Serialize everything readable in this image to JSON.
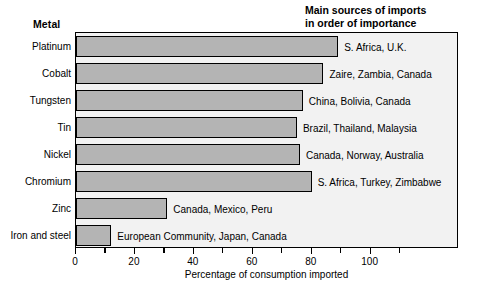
{
  "headers": {
    "metal": "Metal",
    "sources_line1": "Main sources of imports",
    "sources_line2": "in order of importance"
  },
  "chart_data": {
    "type": "bar",
    "orientation": "horizontal",
    "title": "",
    "xlabel": "Percentage of consumption imported",
    "ylabel": "Metal",
    "xlim": [
      0,
      130
    ],
    "xticks": [
      0,
      20,
      40,
      60,
      80,
      100
    ],
    "xtick_labels": [
      "0",
      "20",
      "40",
      "60",
      "80",
      "100"
    ],
    "minor_ticks": [
      10,
      30,
      50,
      70,
      90,
      110
    ],
    "grid": false,
    "legend": "none",
    "bar_color": "#b4b4b4",
    "bar_edge_color": "#000000",
    "plot_background": "#f2f2f2",
    "categories": [
      "Platinum",
      "Cobalt",
      "Tungsten",
      "Tin",
      "Nickel",
      "Chromium",
      "Zinc",
      "Iron and steel"
    ],
    "values": [
      89,
      84,
      77,
      75,
      76,
      80,
      31,
      12
    ],
    "annotations": [
      "S. Africa, U.K.",
      "Zaire, Zambia, Canada",
      "China, Bolivia, Canada",
      "Brazil, Thailand, Malaysia",
      "Canada, Norway, Australia",
      "S. Africa, Turkey, Zimbabwe",
      "Canada, Mexico, Peru",
      "European Community, Japan, Canada"
    ]
  }
}
